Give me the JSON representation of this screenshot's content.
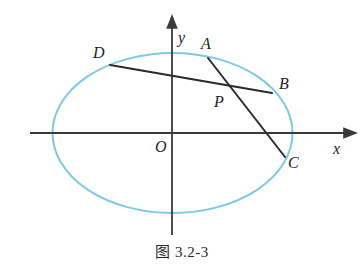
{
  "figure": {
    "caption": "图 3.2-3",
    "background_color": "#ffffff",
    "ellipse_color": "#7ec8e8",
    "line_color": "#2b2b2b",
    "axis_color": "#3a3a3a"
  },
  "axes": {
    "x_label": "x",
    "y_label": "y",
    "origin_label": "O",
    "x_axis": {
      "x1": 30,
      "y1": 133,
      "x2": 352,
      "y2": 133
    },
    "y_axis": {
      "x1": 172,
      "y1": 235,
      "x2": 172,
      "y2": 20
    }
  },
  "conic": {
    "kind": "ellipse",
    "center_x": 172.5,
    "center_y": 133,
    "semi_axis_a": 120,
    "semi_axis_b": 80
  },
  "points": [
    {
      "id": "A",
      "label": "A",
      "x": 208,
      "y": 58,
      "label_x": 201,
      "label_y": 36
    },
    {
      "id": "B",
      "label": "B",
      "x": 272,
      "y": 93,
      "label_x": 279,
      "label_y": 76
    },
    {
      "id": "C",
      "label": "C",
      "x": 285,
      "y": 157,
      "label_x": 288,
      "label_y": 155
    },
    {
      "id": "D",
      "label": "D",
      "x": 110,
      "y": 65,
      "label_x": 93,
      "label_y": 45
    },
    {
      "id": "P",
      "label": "P",
      "x": 231,
      "y": 89,
      "label_x": 214,
      "label_y": 94
    }
  ],
  "chords": [
    {
      "id": "DB",
      "from": "D",
      "to": "B",
      "x1": 110,
      "y1": 65,
      "x2": 272,
      "y2": 93
    },
    {
      "id": "AC",
      "from": "A",
      "to": "C",
      "x1": 208,
      "y1": 58,
      "x2": 285,
      "y2": 157
    }
  ]
}
